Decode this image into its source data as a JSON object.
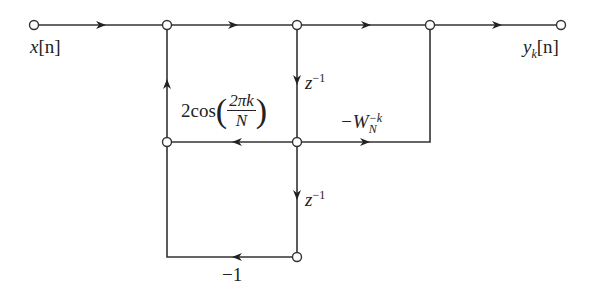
{
  "diagram": {
    "type": "signal-flow-graph",
    "nodes": [
      {
        "id": "input",
        "x": 34,
        "y": 25,
        "label": "x[n]"
      },
      {
        "id": "n1",
        "x": 167,
        "y": 25
      },
      {
        "id": "n2",
        "x": 297,
        "y": 25
      },
      {
        "id": "n3",
        "x": 430,
        "y": 25
      },
      {
        "id": "output",
        "x": 561,
        "y": 25,
        "label": "y_k[n]"
      },
      {
        "id": "n4",
        "x": 167,
        "y": 142
      },
      {
        "id": "n5",
        "x": 297,
        "y": 142
      },
      {
        "id": "n6",
        "x": 297,
        "y": 257
      }
    ],
    "edges": [
      {
        "from": "input",
        "to": "n1",
        "gain": ""
      },
      {
        "from": "n1",
        "to": "n2",
        "gain": ""
      },
      {
        "from": "n2",
        "to": "n3",
        "gain": ""
      },
      {
        "from": "n3",
        "to": "output",
        "gain": ""
      },
      {
        "from": "n2",
        "to": "n5",
        "gain": "z^-1"
      },
      {
        "from": "n5",
        "to": "n4",
        "gain": "2cos(2πk/N)"
      },
      {
        "from": "n4",
        "to": "n1",
        "gain": ""
      },
      {
        "from": "n5",
        "to": "n3",
        "gain": "-W_N^-k"
      },
      {
        "from": "n5",
        "to": "n6",
        "gain": "z^-1"
      },
      {
        "from": "n6",
        "to": "n4",
        "gain": "-1"
      }
    ],
    "labels": {
      "input": {
        "var": "x",
        "arg": "[n]"
      },
      "output": {
        "var": "y",
        "sub": "k",
        "arg": "[n]"
      },
      "delay1": {
        "var": "z",
        "exp": "−1"
      },
      "delay2": {
        "var": "z",
        "exp": "−1"
      },
      "cos_gain": {
        "prefix": "2cos",
        "num": "2πk",
        "den": "N"
      },
      "twiddle": {
        "prefix": "−W",
        "sub": "N",
        "exp": "−k"
      },
      "neg_one": "−1"
    }
  }
}
